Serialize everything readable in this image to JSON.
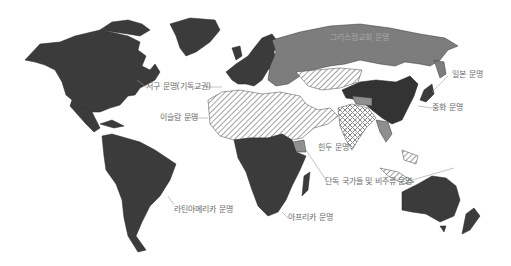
{
  "map": {
    "title": "",
    "colors": {
      "background": "#ffffff",
      "western": "#3b3b3b",
      "latin_america": "#3b3b3b",
      "africa": "#3b3b3b",
      "sinic": "#333333",
      "japanese": "#3b3b3b",
      "orthodox": "#7d7d7d",
      "islamic_hatch": "#8a8a8a",
      "hindu_hatch": "#8a8a8a",
      "lone_buddhist": "#8f8f8f",
      "border": "#222222",
      "leader_line": "#9a9a9a",
      "label_text": "#6a6a6a"
    },
    "regions": [
      {
        "id": "western",
        "label": "서구 문명(기독교권)",
        "fill": "solid-dark"
      },
      {
        "id": "orthodox",
        "label": "그리스정교회 문명",
        "fill": "solid-medium"
      },
      {
        "id": "japanese",
        "label": "일본 문명",
        "fill": "solid-dark"
      },
      {
        "id": "sinic",
        "label": "중화 문명",
        "fill": "solid-darkest"
      },
      {
        "id": "islamic",
        "label": "이슬람 문명",
        "fill": "diagonal-hatch"
      },
      {
        "id": "hindu",
        "label": "힌두 문명",
        "fill": "cross-hatch"
      },
      {
        "id": "lone_buddhist",
        "label": "단독 국가들 및 비주류 문명",
        "fill": "solid-light"
      },
      {
        "id": "latin_america",
        "label": "라틴아메리카 문명",
        "fill": "solid-dark"
      },
      {
        "id": "africa",
        "label": "아프리카 문명",
        "fill": "solid-dark"
      }
    ],
    "labels": {
      "western": "서구 문명(기독교권)",
      "orthodox": "그리스정교회 문명",
      "japanese": "일본 문명",
      "sinic": "중화 문명",
      "islamic": "이슬람 문명",
      "hindu": "힌두 문명",
      "lone": "단독 국가들 및 비주류 문명",
      "latin": "라틴아메리카 문명",
      "africa": "아프리카 문명"
    }
  }
}
